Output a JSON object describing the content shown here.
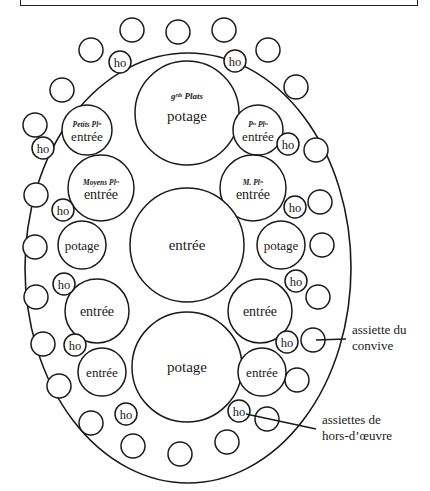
{
  "diagram": {
    "title_box": "",
    "table": {
      "cx": 188,
      "cy": 268,
      "rx": 163,
      "ry": 215
    },
    "plates": [
      {
        "id": "grand-plat-top",
        "cx": 187,
        "cy": 113,
        "r": 52,
        "caption": "gʳᵈˢ Plats",
        "label": "potage"
      },
      {
        "id": "petits-plats-left",
        "cx": 87,
        "cy": 130,
        "r": 25,
        "caption": "Petits Plᵗˢ",
        "label": "entrée"
      },
      {
        "id": "petits-plats-right",
        "cx": 258,
        "cy": 130,
        "r": 25,
        "caption": "Pᵗˢ Plᵗˢ",
        "label": "entrée"
      },
      {
        "id": "moyens-plats-left",
        "cx": 101,
        "cy": 188,
        "r": 33,
        "caption": "Moyens Plᵗˢ",
        "label": "entrée"
      },
      {
        "id": "moyens-plats-right",
        "cx": 253,
        "cy": 188,
        "r": 33,
        "caption": "M. Plᵗˢ",
        "label": "entrée"
      },
      {
        "id": "center",
        "cx": 187,
        "cy": 245,
        "r": 57,
        "caption": "",
        "label": "entrée"
      },
      {
        "id": "potage-left",
        "cx": 82,
        "cy": 245,
        "r": 24,
        "caption": "",
        "label": "potage"
      },
      {
        "id": "potage-right",
        "cx": 281,
        "cy": 245,
        "r": 24,
        "caption": "",
        "label": "potage"
      },
      {
        "id": "entree-left-low",
        "cx": 97,
        "cy": 311,
        "r": 32,
        "caption": "",
        "label": "entrée"
      },
      {
        "id": "entree-right-low",
        "cx": 260,
        "cy": 311,
        "r": 32,
        "caption": "",
        "label": "entrée"
      },
      {
        "id": "potage-bottom",
        "cx": 187,
        "cy": 367,
        "r": 55,
        "caption": "",
        "label": "potage"
      },
      {
        "id": "entree-left-bottom",
        "cx": 102,
        "cy": 372,
        "r": 24,
        "caption": "",
        "label": "entrée"
      },
      {
        "id": "entree-right-bottom",
        "cx": 262,
        "cy": 372,
        "r": 24,
        "caption": "",
        "label": "entrée"
      }
    ],
    "hors_doeuvre": [
      {
        "cx": 120,
        "cy": 62,
        "r": 11,
        "label": "ho"
      },
      {
        "cx": 235,
        "cy": 61,
        "r": 11,
        "label": "ho"
      },
      {
        "cx": 43,
        "cy": 148,
        "r": 11,
        "label": "ho"
      },
      {
        "cx": 288,
        "cy": 144,
        "r": 11,
        "label": "ho"
      },
      {
        "cx": 63,
        "cy": 210,
        "r": 11,
        "label": "ho"
      },
      {
        "cx": 295,
        "cy": 207,
        "r": 11,
        "label": "ho"
      },
      {
        "cx": 64,
        "cy": 284,
        "r": 11,
        "label": "ho"
      },
      {
        "cx": 296,
        "cy": 281,
        "r": 11,
        "label": "ho"
      },
      {
        "cx": 75,
        "cy": 345,
        "r": 11,
        "label": "ho"
      },
      {
        "cx": 287,
        "cy": 342,
        "r": 11,
        "label": "ho"
      },
      {
        "cx": 126,
        "cy": 414,
        "r": 11,
        "label": "ho"
      },
      {
        "cx": 239,
        "cy": 411,
        "r": 11,
        "label": "ho"
      }
    ],
    "guest_plates": [
      {
        "cx": 178,
        "cy": 32,
        "r": 12
      },
      {
        "cx": 132,
        "cy": 30,
        "r": 12
      },
      {
        "cx": 224,
        "cy": 30,
        "r": 12
      },
      {
        "cx": 91,
        "cy": 50,
        "r": 12
      },
      {
        "cx": 268,
        "cy": 50,
        "r": 12
      },
      {
        "cx": 62,
        "cy": 90,
        "r": 12
      },
      {
        "cx": 296,
        "cy": 87,
        "r": 12
      },
      {
        "cx": 35,
        "cy": 125,
        "r": 12
      },
      {
        "cx": 316,
        "cy": 150,
        "r": 12
      },
      {
        "cx": 36,
        "cy": 195,
        "r": 12
      },
      {
        "cx": 320,
        "cy": 202,
        "r": 12
      },
      {
        "cx": 35,
        "cy": 247,
        "r": 12
      },
      {
        "cx": 322,
        "cy": 245,
        "r": 12
      },
      {
        "cx": 36,
        "cy": 297,
        "r": 12
      },
      {
        "cx": 318,
        "cy": 297,
        "r": 12
      },
      {
        "cx": 43,
        "cy": 344,
        "r": 12
      },
      {
        "cx": 313,
        "cy": 340,
        "r": 12
      },
      {
        "cx": 59,
        "cy": 386,
        "r": 12
      },
      {
        "cx": 297,
        "cy": 380,
        "r": 12
      },
      {
        "cx": 91,
        "cy": 423,
        "r": 12
      },
      {
        "cx": 267,
        "cy": 419,
        "r": 12
      },
      {
        "cx": 133,
        "cy": 446,
        "r": 12
      },
      {
        "cx": 227,
        "cy": 442,
        "r": 12
      },
      {
        "cx": 180,
        "cy": 454,
        "r": 12
      }
    ],
    "annotations": [
      {
        "id": "guest-plate",
        "lines": [
          "assiette du",
          "convive"
        ],
        "x": 352,
        "y": 334,
        "from": [
          316,
          340
        ],
        "to": [
          346,
          339
        ]
      },
      {
        "id": "hors-doeuvre-plate",
        "lines": [
          "assiettes de",
          "hors-d’œuvre"
        ],
        "x": 322,
        "y": 424,
        "from": [
          246,
          414
        ],
        "to": [
          316,
          429
        ]
      }
    ]
  }
}
